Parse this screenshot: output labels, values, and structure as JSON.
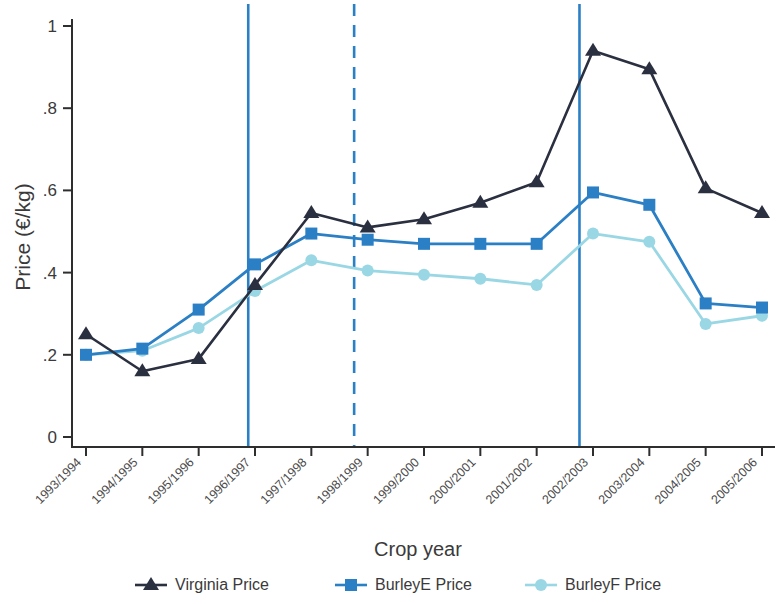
{
  "chart_data": {
    "type": "line",
    "title": "",
    "xlabel": "Crop year",
    "ylabel": "Price (€/kg)",
    "ylim": [
      0,
      1.05
    ],
    "yticks": [
      0,
      0.2,
      0.4,
      0.6,
      0.8,
      1
    ],
    "ytick_labels": [
      "0",
      ".2",
      ".4",
      ".6",
      ".8",
      "1"
    ],
    "grid": false,
    "legend_position": "bottom",
    "categories": [
      "1993/1994",
      "1994/1995",
      "1995/1996",
      "1996/1997",
      "1997/1998",
      "1998/1999",
      "1999/2000",
      "2000/2001",
      "2001/2002",
      "2002/2003",
      "2003/2004",
      "2004/2005",
      "2005/2006"
    ],
    "series": [
      {
        "name": "Virginia Price",
        "color": "#2b3040",
        "marker": "triangle",
        "values": [
          0.25,
          0.16,
          0.19,
          0.37,
          0.545,
          0.51,
          0.53,
          0.57,
          0.62,
          0.94,
          0.895,
          0.605,
          0.545
        ]
      },
      {
        "name": "BurleyE Price",
        "color": "#2b7fc4",
        "marker": "square",
        "values": [
          0.2,
          0.215,
          0.31,
          0.42,
          0.495,
          0.48,
          0.47,
          0.47,
          0.47,
          0.595,
          0.565,
          0.325,
          0.315
        ]
      },
      {
        "name": "BurleyF Price",
        "color": "#9ad7e4",
        "marker": "circle",
        "values": [
          0.2,
          0.21,
          0.265,
          0.355,
          0.43,
          0.405,
          0.395,
          0.385,
          0.37,
          0.495,
          0.475,
          0.275,
          0.295
        ]
      }
    ],
    "reference_lines": [
      {
        "name": "reference-line-1",
        "at_category": "1996/1997",
        "offset": -0.12,
        "style": "solid",
        "color": "#2b7fc4"
      },
      {
        "name": "reference-line-2",
        "at_category": "1998/1999",
        "offset": -0.24,
        "style": "dashed",
        "color": "#2b7fc4"
      },
      {
        "name": "reference-line-3",
        "at_category": "2002/2003",
        "offset": -0.24,
        "style": "solid",
        "color": "#2b7fc4"
      }
    ]
  },
  "legend": {
    "items": [
      {
        "label": "Virginia Price"
      },
      {
        "label": "BurleyE Price"
      },
      {
        "label": "BurleyF Price"
      }
    ]
  },
  "axes": {
    "y_title": "Price (€/kg)",
    "x_title": "Crop year"
  }
}
